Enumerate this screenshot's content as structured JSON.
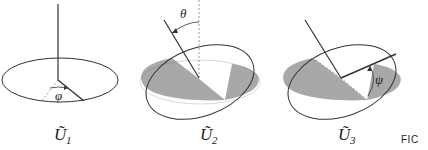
{
  "diagram": {
    "panels": [
      {
        "id": "U1",
        "label": "Ũ",
        "subscript": "1",
        "angle_label": "φ"
      },
      {
        "id": "U2",
        "label": "Ũ",
        "subscript": "2",
        "angle_label": "θ"
      },
      {
        "id": "U3",
        "label": "Ũ",
        "subscript": "3",
        "angle_label": "ψ"
      }
    ],
    "caption_fragment": "FIC",
    "colors": {
      "line": "#333333",
      "shade": "#a8a8a8",
      "dotted": "#999999"
    }
  }
}
